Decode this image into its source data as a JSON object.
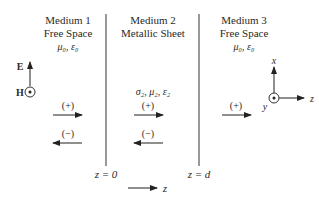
{
  "media": [
    {
      "title": "Medium 1",
      "subtitle": "Free Space",
      "params": "μ₀, ε₀"
    },
    {
      "title": "Medium 2",
      "subtitle": "Metallic Sheet",
      "params": "σ₂, μ₂, ε₂"
    },
    {
      "title": "Medium 3",
      "subtitle": "Free Space",
      "params": "μ₀, ε₀"
    }
  ],
  "boundaries": [
    {
      "label": "z = 0"
    },
    {
      "label": "z = d"
    }
  ],
  "waves": {
    "forward": "(+)",
    "backward": "(−)"
  },
  "field_labels": {
    "e": "E",
    "h": "H"
  },
  "axes": {
    "x": "x",
    "y": "y",
    "z": "z"
  },
  "propagation_axis": "z",
  "colors": {
    "ink": "#2a2a2a",
    "background": "#ffffff"
  }
}
